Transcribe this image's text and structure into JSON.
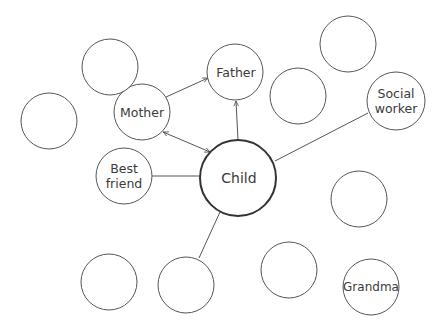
{
  "diagram": {
    "title": "",
    "colors": {
      "stroke": "#555555",
      "child_stroke": "#333333",
      "text": "#3a3a3a"
    },
    "nodes": [
      {
        "id": "child",
        "label": "Child",
        "cx": 238,
        "cy": 178,
        "r": 38,
        "emphasis": true
      },
      {
        "id": "mother",
        "label": "Mother",
        "cx": 142,
        "cy": 112,
        "r": 28
      },
      {
        "id": "father",
        "label": "Father",
        "cx": 235,
        "cy": 72,
        "r": 28
      },
      {
        "id": "best-friend",
        "label_line1": "Best",
        "label_line2": "friend",
        "cx": 124,
        "cy": 176,
        "r": 28
      },
      {
        "id": "social-worker",
        "label_line1": "Social",
        "label_line2": "worker",
        "cx": 394,
        "cy": 101,
        "r": 29
      },
      {
        "id": "grandma",
        "label": "Grandma",
        "cx": 370,
        "cy": 287,
        "r": 28
      },
      {
        "id": "empty-1",
        "cx": 110,
        "cy": 67,
        "r": 28
      },
      {
        "id": "empty-2",
        "cx": 49,
        "cy": 121,
        "r": 28
      },
      {
        "id": "empty-3",
        "cx": 298,
        "cy": 96,
        "r": 28
      },
      {
        "id": "empty-4",
        "cx": 348,
        "cy": 43,
        "r": 28
      },
      {
        "id": "empty-5",
        "cx": 359,
        "cy": 200,
        "r": 28
      },
      {
        "id": "empty-6",
        "cx": 109,
        "cy": 282,
        "r": 28
      },
      {
        "id": "empty-7",
        "cx": 186,
        "cy": 285,
        "r": 28
      },
      {
        "id": "empty-8",
        "cx": 289,
        "cy": 271,
        "r": 28
      }
    ],
    "edges": [
      {
        "from": "mother",
        "to": "father",
        "type": "arrow"
      },
      {
        "from": "mother",
        "to": "child",
        "type": "double-arrow"
      },
      {
        "from": "child",
        "to": "father",
        "type": "arrow"
      },
      {
        "from": "best-friend",
        "to": "child",
        "type": "line"
      },
      {
        "from": "child",
        "to": "social-worker",
        "type": "line"
      },
      {
        "from": "child",
        "to": "empty-7",
        "type": "line"
      }
    ]
  }
}
